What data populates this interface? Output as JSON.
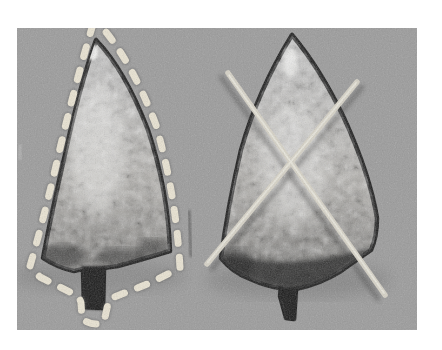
{
  "figure": {
    "left_annotation": "dashed-outline-tracing",
    "right_annotation": "crossed-sticks-x-mark"
  },
  "colors": {
    "page_background": "#ffffff",
    "photo_background": "#9b9b9b",
    "tooth_top": "#c9c9c9",
    "tooth_mid": "#b2b0ac",
    "tooth_bottom": "#6b6a68",
    "tooth_edge": "#1e1e1e",
    "tang_dark": "#151515",
    "dark_blotch": "#222222",
    "dash": "#e9e3d2",
    "dash_halo": "#5e5e5e",
    "stick": "#d6d2c6",
    "stick_highlight": "#f0eee4",
    "stick_shadow": "#2e2e2e",
    "highlight": "#f6f6f4",
    "scratch": "#303030",
    "margin_mark": "#c6c6c6"
  }
}
